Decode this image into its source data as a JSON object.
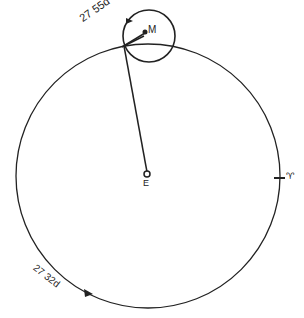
{
  "diagram": {
    "title": "",
    "labels": {
      "earth": "E",
      "moon": "M",
      "vernal_equinox": "♈",
      "synodic_period": "27 55d",
      "sidereal_period": "27 32d"
    },
    "colors": {
      "stroke": "#222222",
      "background": "#ffffff"
    }
  }
}
